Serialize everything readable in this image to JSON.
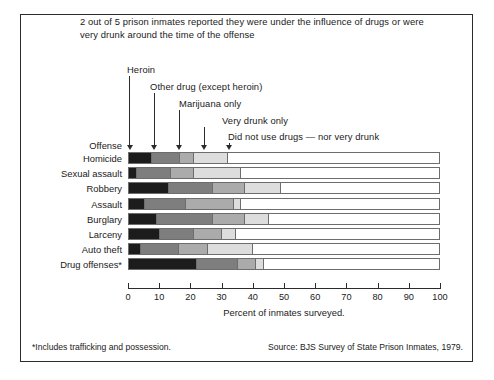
{
  "headline": "2 out of 5 prison inmates reported they were under the influence of drugs or were very drunk around the time of the offense",
  "offense_heading": "Offense",
  "xaxis_title": "Percent of inmates surveyed.",
  "footnote": "*Includes trafficking and possession.",
  "source": "Source:  BJS Survey of State Prison Inmates, 1979.",
  "callouts": [
    {
      "label": "Heroin",
      "target_value": 0
    },
    {
      "label": "Other drug (except heroin)",
      "target_value": 8
    },
    {
      "label": "Marijuana only",
      "target_value": 16
    },
    {
      "label": "Very drunk only",
      "target_value": 24
    },
    {
      "label": "Did not use drugs — nor very drunk",
      "target_value": 32
    }
  ],
  "colors": {
    "heroin": "#1c1c1c",
    "other_drug": "#7e7e7e",
    "marijuana_only": "#ababab",
    "very_drunk_only": "#dddddd",
    "none": "#ffffff",
    "bar_outline": "#6d6d6d",
    "frame": "#2b2b2b",
    "text": "#1a1a1a"
  },
  "chart_data": {
    "type": "bar",
    "title": "2 out of 5 prison inmates reported they were under the influence of drugs or were very drunk around the time of the offense",
    "subtitle": "",
    "orientation": "horizontal",
    "stacked": true,
    "xlabel": "Percent of inmates surveyed.",
    "ylabel": "Offense",
    "xlim": [
      0,
      100
    ],
    "xticks": [
      0,
      10,
      20,
      30,
      40,
      50,
      60,
      70,
      80,
      90,
      100
    ],
    "xtick_labels": [
      "0",
      "10",
      "20",
      "30",
      "40",
      "50",
      "60",
      "70",
      "80",
      "90",
      "100"
    ],
    "grid": false,
    "legend": "annotated-callouts",
    "categories": [
      "Homicide",
      "Sexual assault",
      "Robbery",
      "Assault",
      "Burglary",
      "Larceny",
      "Auto theft",
      "Drug offenses*"
    ],
    "series": [
      {
        "name": "Heroin",
        "values": [
          7.5,
          2.5,
          13.0,
          5.0,
          9.0,
          10.0,
          4.0,
          22.0
        ]
      },
      {
        "name": "Other drug (except heroin)",
        "values": [
          9.0,
          11.0,
          14.0,
          13.5,
          18.0,
          11.0,
          12.0,
          13.0
        ]
      },
      {
        "name": "Marijuana only",
        "values": [
          4.5,
          7.5,
          10.5,
          15.5,
          10.5,
          9.0,
          9.5,
          6.0
        ]
      },
      {
        "name": "Very drunk only",
        "values": [
          11.0,
          15.0,
          11.5,
          2.0,
          7.5,
          4.5,
          14.5,
          2.5
        ]
      },
      {
        "name": "Did not use drugs — nor very drunk",
        "values": [
          68.0,
          64.0,
          51.0,
          64.0,
          55.0,
          65.5,
          60.0,
          56.5
        ]
      }
    ],
    "annotations": [
      "Heroin",
      "Other drug (except heroin)",
      "Marijuana only",
      "Very drunk only",
      "Did not use drugs — nor very drunk"
    ],
    "footnote": "*Includes trafficking and possession.",
    "source": "Source:  BJS Survey of State Prison Inmates, 1979."
  }
}
